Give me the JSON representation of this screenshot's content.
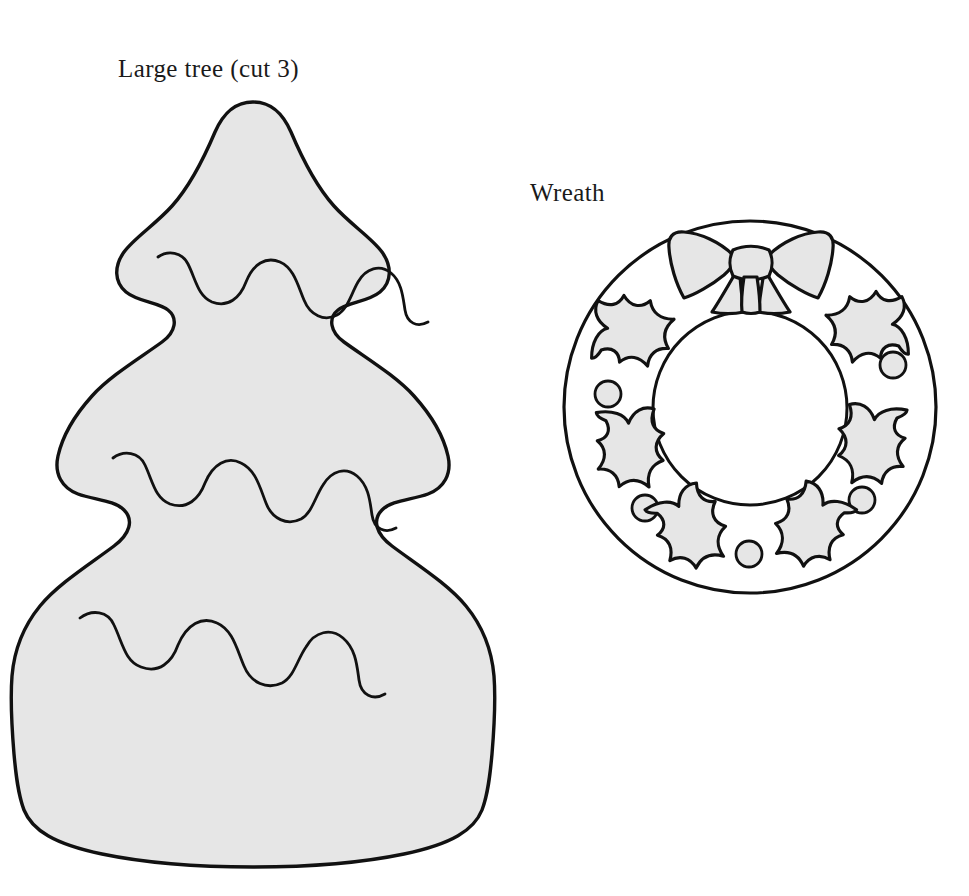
{
  "page": {
    "background_color": "#ffffff",
    "width": 969,
    "height": 896,
    "kind": "craft-pattern-template-sheet"
  },
  "labels": {
    "tree": "Large tree (cut 3)",
    "wreath": "Wreath"
  },
  "style": {
    "outline_color": "#111111",
    "fill_color": "#e6e6e6",
    "inner_fill_color": "#ffffff",
    "outline_width_outer": 3.2,
    "outline_width_inner": 2.6,
    "detail_line_width": 2.6
  },
  "patterns": [
    {
      "id": "large-tree",
      "name": "Large tree",
      "cut_instruction": "cut 3",
      "cut_count": 3,
      "bounds": {
        "x": 12,
        "y": 100,
        "width": 485,
        "height": 768
      },
      "tiers": 3,
      "garland_rows": 3,
      "shape": "scalloped three-tier christmas tree silhouette"
    },
    {
      "id": "wreath",
      "name": "Wreath",
      "cut_instruction": "",
      "bounds": {
        "x": 563,
        "y": 218,
        "width": 374,
        "height": 379
      },
      "outer_circle": {
        "cx": 750,
        "cy": 407,
        "r": 186
      },
      "inner_circle": {
        "cx": 750,
        "cy": 408,
        "r": 97
      },
      "holly_leaf_count": 6,
      "berry_count": 4,
      "bow": {
        "loops": 2,
        "tails": 2,
        "position": "top-center"
      }
    }
  ],
  "tree_geometry": {
    "outline": "M 253 103 C 286 103 296 130 306 152 C 320 184 338 207 358 222 C 378 237 391 250 391 268 C 391 288 374 299 358 303 C 342 307 330 313 330 327 C 330 343 348 352 372 366 C 400 383 422 404 434 424 C 447 446 452 460 452 474 C 452 492 436 501 418 505 C 400 509 388 517 388 531 C 388 548 406 559 432 577 C 458 595 478 620 486 648 C 494 676 496 700 495 726 C 494 752 492 776 492 794 C 492 812 486 828 470 840 C 450 854 400 864 318 866 C 270 867 222 867 180 866 C 100 864 52 854 32 840 C 16 828 12 812 12 794 C 12 776 12 752 10 726 C 9 700 12 676 20 648 C 28 620 48 595 74 577 C 100 559 118 548 118 531 C 118 517 106 509 88 505 C 70 501 54 492 54 474 C 54 460 59 446 72 424 C 84 404 106 383 134 366 C 158 352 176 343 176 327 C 176 313 164 307 148 303 C 132 299 115 288 115 268 C 115 250 128 237 148 222 C 168 207 186 184 200 152 C 210 130 220 103 253 103 Z",
    "garlands": [
      "M 130 262 C 144 253 160 258 166 272 C 174 290 178 304 192 308 C 208 312 218 302 224 286 C 232 266 244 258 258 262 C 272 266 276 284 282 300 C 288 316 300 324 314 318 C 326 313 330 298 336 286 C 343 272 356 266 368 273 C 380 280 382 296 384 310 C 386 324 396 330 408 326",
      "M 95 447 C 110 437 126 443 132 458 C 140 477 144 491 158 495 C 174 499 184 488 190 472 C 198 451 211 443 225 448 C 239 453 243 471 249 487 C 255 503 268 511 282 505 C 294 500 298 484 304 472 C 311 457 325 451 337 459 C 349 467 351 484 353 498 C 355 513 366 519 378 514",
      "M 62 613 C 77 602 94 609 100 625 C 108 645 112 660 127 664 C 144 668 155 656 161 639 C 170 617 184 608 199 613 C 214 619 218 638 225 655 C 231 672 245 681 260 674 C 273 669 277 652 284 639 C 292 623 307 617 319 626 C 332 635 334 653 336 668 C 338 684 350 690 363 685"
    ]
  },
  "wreath_geometry": {
    "holly_leaves": [
      {
        "cx": 640,
        "cy": 320,
        "rot": -38
      },
      {
        "cx": 640,
        "cy": 450,
        "rot": 38
      },
      {
        "cx": 722,
        "cy": 530,
        "rot": 10
      },
      {
        "cx": 855,
        "cy": 315,
        "rot": 38
      },
      {
        "cx": 858,
        "cy": 448,
        "rot": -35
      },
      {
        "cx": 805,
        "cy": 530,
        "rot": -15
      }
    ],
    "berries": [
      {
        "cx": 608,
        "cy": 394,
        "r": 13
      },
      {
        "cx": 893,
        "cy": 365,
        "r": 13
      },
      {
        "cx": 645,
        "cy": 508,
        "r": 13
      },
      {
        "cx": 861,
        "cy": 500,
        "r": 13
      },
      {
        "cx": 749,
        "cy": 554,
        "r": 13
      }
    ],
    "leaf_path": "M 0 0 C 14 -6 26 -18 34 -30 C 36 -16 42 -10 54 -12 C 48 -2 46 6 52 16 C 40 14 32 18 28 30 C 20 20 10 18 0 24 C 4 12 2 6 -6 0 C 2 -2 2 -2 0 0 Z"
  }
}
